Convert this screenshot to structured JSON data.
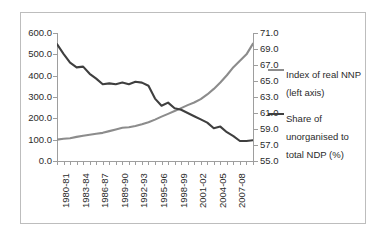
{
  "chart_data": {
    "type": "line",
    "title": "",
    "xlabel": "",
    "ylabel": "",
    "grid": false,
    "legend_position": "right",
    "x": [
      "1980-81",
      "1981-82",
      "1982-83",
      "1983-84",
      "1984-85",
      "1985-86",
      "1986-87",
      "1987-88",
      "1988-89",
      "1989-90",
      "1990-91",
      "1991-92",
      "1992-93",
      "1993-94",
      "1994-95",
      "1995-96",
      "1996-97",
      "1997-98",
      "1998-99",
      "1999-00",
      "2000-01",
      "2001-02",
      "2002-03",
      "2003-04",
      "2004-05",
      "2005-06",
      "2006-07",
      "2007-08",
      "2008-09",
      "2009-10",
      "2010-11"
    ],
    "x_tick_labels": [
      "1980-81",
      "1983-84",
      "1986-87",
      "1989-90",
      "1992-93",
      "1995-96",
      "1998-99",
      "2001-02",
      "2004-05",
      "2007-08"
    ],
    "axes": [
      {
        "id": "left",
        "name": "Index of real NNP (left axis)",
        "ylim": [
          0.0,
          600.0
        ],
        "ytick_step": 100.0,
        "ytick_labels": [
          "600.0",
          "500.0",
          "400.0",
          "300.0",
          "200.0",
          "100.0",
          "0.0"
        ]
      },
      {
        "id": "right",
        "name": "Share of unorganised to total NDP (%)",
        "ylim": [
          55.0,
          71.0
        ],
        "ytick_step": 2.0,
        "ytick_labels": [
          "71.0",
          "69.0",
          "67.0",
          "65.0",
          "63.0",
          "61.0",
          "59.0",
          "57.0",
          "55.0"
        ]
      }
    ],
    "series": [
      {
        "name": "Index of real NNP (left axis)",
        "axis": "left",
        "color": "#8c8c8c",
        "values": [
          100,
          104,
          107,
          113,
          118,
          123,
          128,
          132,
          140,
          148,
          156,
          158,
          164,
          172,
          182,
          194,
          208,
          221,
          234,
          248,
          262,
          274,
          290,
          312,
          338,
          368,
          402,
          440,
          470,
          500,
          550
        ]
      },
      {
        "name": "Share of unorganised to total NDP (%)",
        "axis": "right",
        "color": "#3f3f3f",
        "values": [
          69.6,
          68.4,
          67.3,
          66.7,
          66.8,
          65.9,
          65.3,
          64.6,
          64.7,
          64.6,
          64.8,
          64.6,
          64.9,
          64.8,
          64.4,
          62.8,
          61.9,
          62.3,
          61.6,
          61.4,
          61.0,
          60.6,
          60.2,
          59.8,
          59.1,
          59.3,
          58.6,
          58.1,
          57.5,
          57.5,
          57.6
        ]
      }
    ]
  },
  "legend": {
    "items": [
      {
        "label": "Index of real NNP (left axis)",
        "color": "#8c8c8c"
      },
      {
        "label": "Share of unorganised to total NDP (%)",
        "color": "#3f3f3f"
      }
    ]
  }
}
